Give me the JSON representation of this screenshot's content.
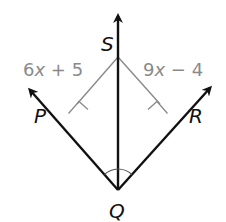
{
  "diagram": {
    "points": {
      "S": {
        "label": "S",
        "x": 118,
        "y": 57
      },
      "P": {
        "label": "P",
        "x": 80,
        "y": 124
      },
      "Q": {
        "label": "Q",
        "x": 118,
        "y": 190
      },
      "R": {
        "label": "R",
        "x": 156,
        "y": 124
      }
    },
    "expressions": {
      "left": {
        "text_num": "6",
        "text_var": "x",
        "text_rest": " + 5"
      },
      "right": {
        "text_num": "9",
        "text_var": "x",
        "text_rest": " − 4"
      }
    },
    "colors": {
      "ray": "#111111",
      "perpendicular": "#8a8a8a",
      "expression": "#8a8a8a"
    },
    "marks": {
      "right_angles": [
        "P",
        "R"
      ],
      "congruent_angles_at": "Q"
    }
  }
}
